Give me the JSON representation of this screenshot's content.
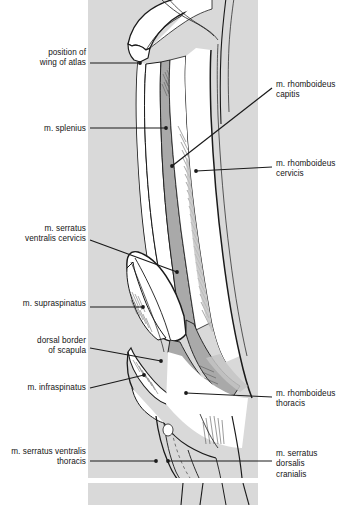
{
  "figure": {
    "background_color": "#ffffff",
    "panel_color": "#d9d9d9",
    "muscle_fill_color": "#a9a9a9",
    "muscle_fill_light": "#c4c4c4",
    "outline_color": "#1a1a1a",
    "leader_color": "#1a1a1a",
    "panel": {
      "x": 88,
      "y": 0,
      "width": 170,
      "height": 478
    },
    "panel_lower": {
      "x": 88,
      "y": 483,
      "width": 170,
      "height": 22
    }
  },
  "labels": {
    "left": [
      {
        "name": "position-of-wing-of-atlas",
        "text": "position of\nwing of atlas",
        "text_x": 14,
        "text_y": 48,
        "text_width": 72,
        "leader": [
          [
            90,
            63
          ],
          [
            140,
            63
          ]
        ],
        "dot": [
          140,
          63
        ]
      },
      {
        "name": "m-splenius",
        "text": "m. splenius",
        "text_x": 14,
        "text_y": 124,
        "text_width": 72,
        "leader": [
          [
            90,
            128
          ],
          [
            166,
            128
          ]
        ],
        "dot": [
          166,
          128
        ]
      },
      {
        "name": "m-serratus-ventralis-cervicis",
        "text": "m. serratus\nventralis cervicis",
        "text_x": 6,
        "text_y": 224,
        "text_width": 80,
        "leader": [
          [
            90,
            240
          ],
          [
            177,
            272
          ]
        ],
        "dot": [
          177,
          272
        ]
      },
      {
        "name": "m-supraspinatus",
        "text": "m. supraspinatus",
        "text_x": 6,
        "text_y": 299,
        "text_width": 80,
        "leader": [
          [
            90,
            307
          ],
          [
            143,
            307
          ]
        ],
        "dot": [
          143,
          307
        ]
      },
      {
        "name": "dorsal-border-of-scapula",
        "text": "dorsal border\nof scapula",
        "text_x": 14,
        "text_y": 336,
        "text_width": 72,
        "leader": [
          [
            90,
            348
          ],
          [
            161,
            361
          ]
        ],
        "dot": [
          161,
          361
        ]
      },
      {
        "name": "m-infraspinatus",
        "text": "m. infraspinatus",
        "text_x": 6,
        "text_y": 383,
        "text_width": 80,
        "leader": [
          [
            90,
            388
          ],
          [
            144,
            375
          ]
        ],
        "dot": [
          144,
          375
        ]
      },
      {
        "name": "m-serratus-ventralis-thoracis",
        "text": "m. serratus ventralis\nthoracis",
        "text_x": -2,
        "text_y": 447,
        "text_width": 88,
        "leader": [
          [
            90,
            461
          ],
          [
            156,
            461
          ]
        ],
        "dot": [
          156,
          461
        ]
      }
    ],
    "right": [
      {
        "name": "m-rhomboideus-capitis",
        "text": "m.  rhomboideus\ncapitis",
        "text_x": 276,
        "text_y": 80,
        "text_width": 69,
        "leader": [
          [
            272,
            88
          ],
          [
            172,
            166
          ]
        ],
        "dot": [
          172,
          166
        ]
      },
      {
        "name": "m-rhomboideus-cervicis",
        "text": "m. rhomboideus\ncervicis",
        "text_x": 276,
        "text_y": 159,
        "text_width": 69,
        "leader": [
          [
            272,
            167
          ],
          [
            196,
            171
          ]
        ],
        "dot": [
          196,
          171
        ]
      },
      {
        "name": "m-rhomboideus-thoracis",
        "text": "m. rhomboideus\nthoracis",
        "text_x": 276,
        "text_y": 389,
        "text_width": 69,
        "leader": [
          [
            272,
            397
          ],
          [
            186,
            393
          ]
        ],
        "dot": [
          186,
          393
        ]
      },
      {
        "name": "m-serratus-dorsalis-cranialis",
        "text": "m. serratus dorsalis\ncranialis",
        "text_x": 276,
        "text_y": 449,
        "text_width": 69,
        "leader": [
          [
            272,
            461
          ],
          [
            168,
            461
          ]
        ],
        "dot": [
          168,
          461
        ]
      }
    ]
  }
}
